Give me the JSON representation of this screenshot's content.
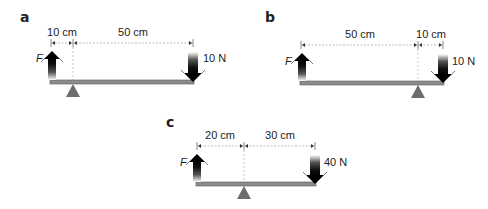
{
  "panels": [
    {
      "label": "a",
      "left_distance": "10 cm",
      "right_distance": "50 cm",
      "effort_label": "F",
      "load_label": "10 N",
      "fulcrum_position": "left"
    },
    {
      "label": "b",
      "left_distance": "50 cm",
      "right_distance": "10 cm",
      "effort_label": "F",
      "load_label": "10 N",
      "fulcrum_position": "right"
    },
    {
      "label": "c",
      "left_distance": "20 cm",
      "right_distance": "30 cm",
      "effort_label": "F",
      "load_label": "40 N",
      "fulcrum_position": "middle"
    }
  ],
  "colors": {
    "beam": "#8c8c8c",
    "beam_edge": "#5a5a5a",
    "fulcrum": "#6d6d6d",
    "arrow": "#111111",
    "dimension_line": "#bdbdbd"
  }
}
